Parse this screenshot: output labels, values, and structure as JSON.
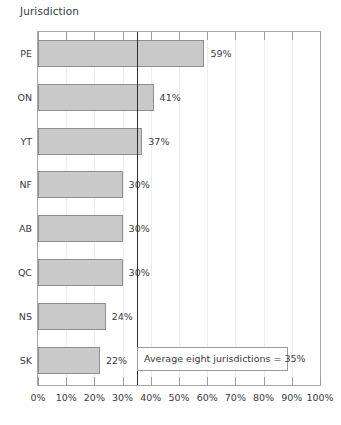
{
  "chart_data": {
    "type": "bar",
    "orientation": "horizontal",
    "title": "Jurisdiction",
    "xlabel": "",
    "ylabel": "Jurisdiction",
    "categories": [
      "PE",
      "ON",
      "YT",
      "NF",
      "AB",
      "QC",
      "NS",
      "SK"
    ],
    "values": [
      59,
      41,
      37,
      30,
      30,
      30,
      24,
      22
    ],
    "value_labels": [
      "59%",
      "41%",
      "37%",
      "30%",
      "30%",
      "30%",
      "24%",
      "22%"
    ],
    "xlim": [
      0,
      100
    ],
    "xticks": [
      0,
      10,
      20,
      30,
      40,
      50,
      60,
      70,
      80,
      90,
      100
    ],
    "xtick_labels": [
      "0%",
      "10%",
      "20%",
      "30%",
      "40%",
      "50%",
      "60%",
      "70%",
      "80%",
      "90%",
      "100%"
    ],
    "grid": true,
    "legend": false,
    "reference_line": {
      "value": 35,
      "label": "Average eight jurisdictions = 35%"
    },
    "colors": {
      "bar_fill": "#c9c9c9",
      "bar_border": "#8e8e8e",
      "reference_line": "#2f2f2f",
      "gridline": "#ededed",
      "axis": "#a8a8a8",
      "text": "#3a3a3a"
    }
  },
  "annotation": {
    "text": "Average eight jurisdictions = 35%"
  }
}
